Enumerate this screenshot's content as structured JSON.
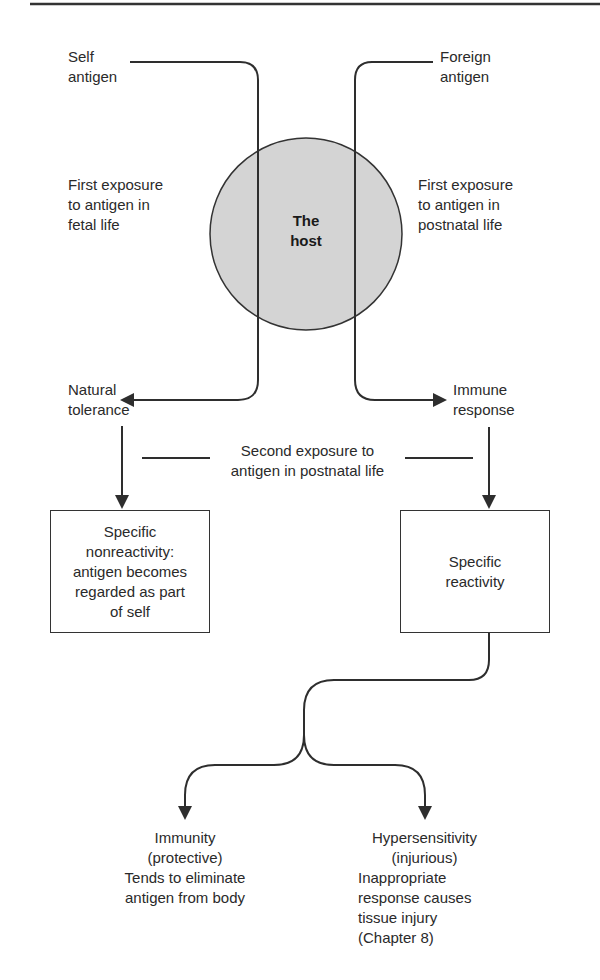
{
  "diagram": {
    "nodes": {
      "self_antigen": "Self\nantigen",
      "foreign_antigen": "Foreign\nantigen",
      "host": "The\nhost",
      "fetal_exposure": "First exposure\nto antigen in\nfetal life",
      "postnatal_exposure": "First exposure\nto antigen in\npostnatal life",
      "natural_tolerance": "Natural\ntolerance",
      "immune_response": "Immune\nresponse",
      "second_exposure": "Second exposure to\nantigen in postnatal life",
      "specific_nonreactivity": "Specific\nnonreactivity:\nantigen becomes\nregarded as part\nof self",
      "specific_reactivity": "Specific\nreactivity",
      "immunity": "Immunity\n(protective)\nTends to eliminate\nantigen from body",
      "hypersensitivity_title": "Hypersensitivity\n(injurious)",
      "hypersensitivity_desc": "Inappropriate\nresponse causes\ntissue injury\n(Chapter 8)"
    },
    "colors": {
      "host_fill": "#d4d4d4",
      "line": "#2e2e2e"
    }
  }
}
